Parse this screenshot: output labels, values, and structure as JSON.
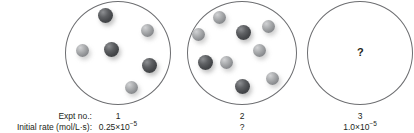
{
  "figure": {
    "flasks": [
      {
        "id": "flask-1",
        "cx": 118,
        "cy": 53,
        "rx": 53,
        "ry": 52,
        "spheres": [
          {
            "x": 105,
            "y": 15,
            "r": 7.5,
            "shade": "dark"
          },
          {
            "x": 147,
            "y": 30,
            "r": 6.5,
            "shade": "light"
          },
          {
            "x": 82,
            "y": 50,
            "r": 6.5,
            "shade": "light"
          },
          {
            "x": 111,
            "y": 49,
            "r": 7.5,
            "shade": "dark"
          },
          {
            "x": 149,
            "y": 65,
            "r": 7.5,
            "shade": "dark"
          },
          {
            "x": 131,
            "y": 87,
            "r": 6.5,
            "shade": "light"
          }
        ],
        "marker": null
      },
      {
        "id": "flask-2",
        "cx": 242,
        "cy": 53,
        "rx": 55,
        "ry": 52,
        "spheres": [
          {
            "x": 219,
            "y": 17,
            "r": 6.5,
            "shade": "light"
          },
          {
            "x": 198,
            "y": 34,
            "r": 6.5,
            "shade": "light"
          },
          {
            "x": 243,
            "y": 32,
            "r": 7.5,
            "shade": "dark"
          },
          {
            "x": 268,
            "y": 26,
            "r": 6.5,
            "shade": "light"
          },
          {
            "x": 259,
            "y": 50,
            "r": 6.5,
            "shade": "light"
          },
          {
            "x": 205,
            "y": 62,
            "r": 7.5,
            "shade": "dark"
          },
          {
            "x": 226,
            "y": 62,
            "r": 6.5,
            "shade": "light"
          },
          {
            "x": 242,
            "y": 86,
            "r": 7.5,
            "shade": "dark"
          },
          {
            "x": 272,
            "y": 78,
            "r": 6.5,
            "shade": "light"
          }
        ],
        "marker": null
      },
      {
        "id": "flask-3",
        "cx": 360,
        "cy": 53,
        "rx": 53,
        "ry": 52,
        "spheres": [],
        "marker": "?"
      }
    ],
    "labels": {
      "expt_no": "Expt no.:",
      "initial_rate": "Initial rate (mol/L·s):"
    },
    "columns": [
      {
        "expt_no": "1",
        "rate_mantissa": "0.25×10",
        "rate_exponent": "−5",
        "x": 118
      },
      {
        "expt_no": "2",
        "rate_mantissa": "?",
        "rate_exponent": "",
        "x": 242
      },
      {
        "expt_no": "3",
        "rate_mantissa": "1.0×10",
        "rate_exponent": "−5",
        "x": 360
      }
    ]
  }
}
